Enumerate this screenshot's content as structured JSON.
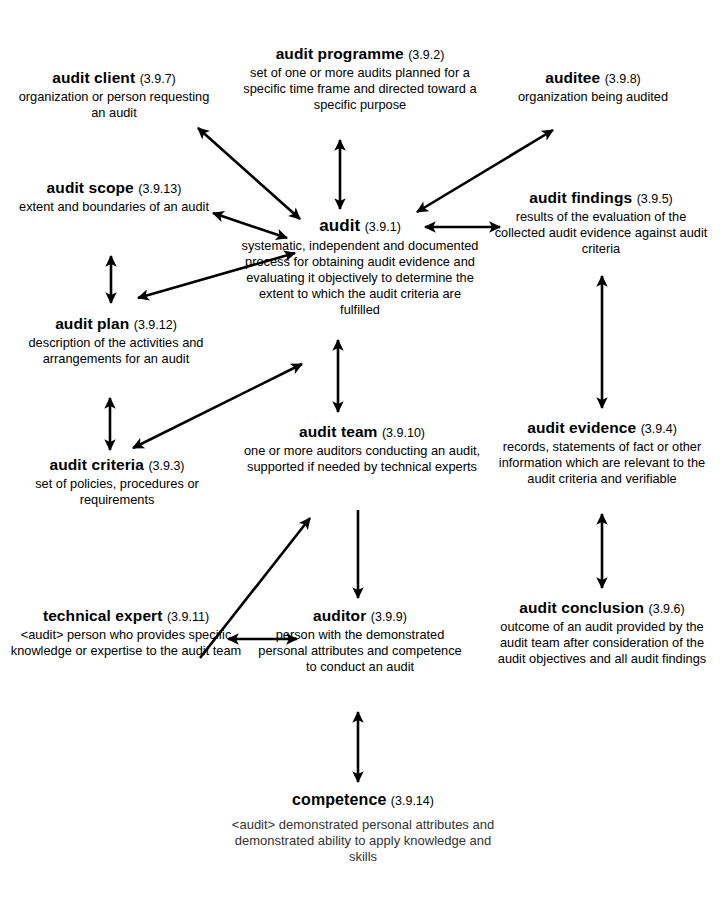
{
  "diagram": {
    "line_color": "#000000",
    "background": "#ffffff",
    "nodes": [
      {
        "id": "audit_client",
        "term": "audit client",
        "ref": "(3.9.7)",
        "definition": "organization or person requesting an audit"
      },
      {
        "id": "audit_programme",
        "term": "audit programme",
        "ref": "(3.9.2)",
        "definition": "set of one or more audits planned for a specific time frame and directed toward a specific purpose"
      },
      {
        "id": "auditee",
        "term": "auditee",
        "ref": "(3.9.8)",
        "definition": "organization being audited"
      },
      {
        "id": "audit_scope",
        "term": "audit scope",
        "ref": "(3.9.13)",
        "definition": "extent and boundaries of an audit"
      },
      {
        "id": "audit",
        "term": "audit",
        "ref": "(3.9.1)",
        "definition": "systematic, independent and documented process for obtaining audit evidence and evaluating it objectively to determine the extent to which the audit criteria are fulfilled"
      },
      {
        "id": "audit_findings",
        "term": "audit findings",
        "ref": "(3.9.5)",
        "definition": "results of the evaluation of the collected audit evidence against audit criteria"
      },
      {
        "id": "audit_plan",
        "term": "audit plan",
        "ref": "(3.9.12)",
        "definition": "description of the activities and arrangements for an audit"
      },
      {
        "id": "audit_criteria",
        "term": "audit criteria",
        "ref": "(3.9.3)",
        "definition": "set of policies, procedures or requirements"
      },
      {
        "id": "audit_team",
        "term": "audit team",
        "ref": "(3.9.10)",
        "definition": "one or more auditors conducting an audit, supported if needed by technical experts"
      },
      {
        "id": "audit_evidence",
        "term": "audit evidence",
        "ref": "(3.9.4)",
        "definition": "records, statements of fact or other information which are relevant to the audit criteria and verifiable"
      },
      {
        "id": "technical_expert",
        "term": "technical expert",
        "ref": "(3.9.11)",
        "definition": "<audit> person who provides specific knowledge or expertise to the audit team"
      },
      {
        "id": "auditor",
        "term": "auditor",
        "ref": "(3.9.9)",
        "definition": "person with the demonstrated personal attributes and competence to conduct an audit"
      },
      {
        "id": "audit_conclusion",
        "term": "audit conclusion",
        "ref": "(3.9.6)",
        "definition": "outcome of an audit provided by the audit team after consideration of the audit objectives and all audit findings"
      },
      {
        "id": "competence",
        "term": "competence",
        "ref": "(3.9.14)",
        "definition": "<audit> demonstrated personal attributes and demonstrated ability to apply knowledge and skills"
      }
    ],
    "connections": [
      {
        "from": "audit",
        "to": "audit_client",
        "heads": "both"
      },
      {
        "from": "audit",
        "to": "audit_programme",
        "heads": "both"
      },
      {
        "from": "audit",
        "to": "auditee",
        "heads": "both"
      },
      {
        "from": "audit",
        "to": "audit_scope",
        "heads": "both"
      },
      {
        "from": "audit",
        "to": "audit_findings",
        "heads": "both"
      },
      {
        "from": "audit_scope",
        "to": "audit_plan",
        "heads": "both"
      },
      {
        "from": "audit_plan",
        "to": "audit",
        "heads": "both"
      },
      {
        "from": "audit_plan",
        "to": "audit_criteria",
        "heads": "both"
      },
      {
        "from": "audit_criteria",
        "to": "audit_team",
        "heads": "both"
      },
      {
        "from": "audit",
        "to": "audit_team",
        "heads": "both"
      },
      {
        "from": "audit_findings",
        "to": "audit_evidence",
        "heads": "both"
      },
      {
        "from": "audit_evidence",
        "to": "audit_conclusion",
        "heads": "both"
      },
      {
        "from": "technical_expert",
        "to": "audit_team",
        "heads": "single"
      },
      {
        "from": "audit_team",
        "to": "auditor",
        "heads": "single"
      },
      {
        "from": "technical_expert",
        "to": "auditor",
        "heads": "both"
      },
      {
        "from": "auditor",
        "to": "competence",
        "heads": "both"
      }
    ]
  }
}
